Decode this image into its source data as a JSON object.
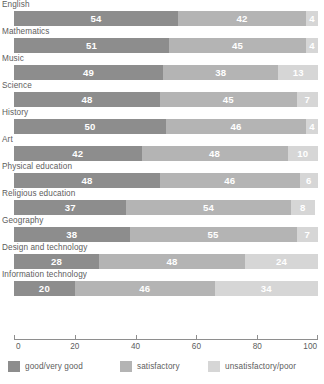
{
  "chart_data": {
    "type": "bar",
    "orientation": "horizontal",
    "stacked": true,
    "title": "",
    "xlabel": "",
    "ylabel": "",
    "xlim": [
      0,
      100
    ],
    "xticks": [
      0,
      20,
      40,
      60,
      80,
      100
    ],
    "grid": false,
    "legend_position": "bottom",
    "categories": [
      "English",
      "Mathematics",
      "Music",
      "Science",
      "History",
      "Art",
      "Physical education",
      "Religious education",
      "Geography",
      "Design and technology",
      "Information technology"
    ],
    "series": [
      {
        "name": "good/very good",
        "color": "#8d8d8d",
        "values": [
          54,
          51,
          49,
          48,
          50,
          42,
          48,
          37,
          38,
          28,
          20
        ]
      },
      {
        "name": "satisfactory",
        "color": "#b4b4b4",
        "values": [
          42,
          45,
          38,
          45,
          46,
          48,
          46,
          54,
          55,
          48,
          46
        ]
      },
      {
        "name": "unsatisfactory/poor",
        "color": "#d6d6d6",
        "values": [
          4,
          4,
          13,
          7,
          4,
          10,
          6,
          8,
          7,
          24,
          34
        ]
      }
    ]
  },
  "axis": {
    "tick_labels": [
      "0",
      "20",
      "40",
      "60",
      "80",
      "100"
    ]
  }
}
